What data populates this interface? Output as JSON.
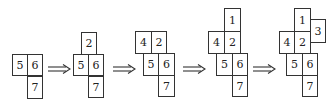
{
  "stages": [
    {
      "cells": [
        {
          "label": "5",
          "x": 12,
          "y": 54,
          "w": 16,
          "h": 22
        },
        {
          "label": "6",
          "x": 27,
          "y": 54,
          "w": 16,
          "h": 22
        },
        {
          "label": "7",
          "x": 27,
          "y": 76,
          "w": 16,
          "h": 23
        }
      ]
    },
    {
      "cells": [
        {
          "label": "2",
          "x": 81,
          "y": 32,
          "w": 16,
          "h": 23
        },
        {
          "label": "5",
          "x": 73,
          "y": 54,
          "w": 16,
          "h": 22
        },
        {
          "label": "6",
          "x": 88,
          "y": 54,
          "w": 16,
          "h": 22
        },
        {
          "label": "7",
          "x": 88,
          "y": 76,
          "w": 16,
          "h": 22
        }
      ]
    },
    {
      "cells": [
        {
          "label": "4",
          "x": 135,
          "y": 31,
          "w": 17,
          "h": 23
        },
        {
          "label": "2",
          "x": 151,
          "y": 31,
          "w": 16,
          "h": 23
        },
        {
          "label": "5",
          "x": 143,
          "y": 53,
          "w": 16,
          "h": 23
        },
        {
          "label": "6",
          "x": 158,
          "y": 53,
          "w": 17,
          "h": 23
        },
        {
          "label": "7",
          "x": 158,
          "y": 75,
          "w": 17,
          "h": 22
        }
      ]
    },
    {
      "cells": [
        {
          "label": "1",
          "x": 224,
          "y": 8,
          "w": 17,
          "h": 24
        },
        {
          "label": "4",
          "x": 208,
          "y": 31,
          "w": 17,
          "h": 23
        },
        {
          "label": "2",
          "x": 224,
          "y": 31,
          "w": 17,
          "h": 23
        },
        {
          "label": "5",
          "x": 216,
          "y": 53,
          "w": 17,
          "h": 23
        },
        {
          "label": "6",
          "x": 232,
          "y": 53,
          "w": 16,
          "h": 23
        },
        {
          "label": "7",
          "x": 232,
          "y": 75,
          "w": 16,
          "h": 22
        }
      ]
    },
    {
      "cells": [
        {
          "label": "1",
          "x": 294,
          "y": 8,
          "w": 17,
          "h": 24
        },
        {
          "label": "3",
          "x": 310,
          "y": 19,
          "w": 16,
          "h": 24
        },
        {
          "label": "4",
          "x": 279,
          "y": 31,
          "w": 16,
          "h": 23
        },
        {
          "label": "2",
          "x": 294,
          "y": 31,
          "w": 17,
          "h": 23
        },
        {
          "label": "5",
          "x": 286,
          "y": 53,
          "w": 17,
          "h": 23
        },
        {
          "label": "6",
          "x": 302,
          "y": 53,
          "w": 16,
          "h": 23
        },
        {
          "label": "7",
          "x": 302,
          "y": 75,
          "w": 16,
          "h": 22
        }
      ]
    }
  ],
  "arrows": [
    {
      "symbol": "double-right-arrow",
      "x": 48,
      "y": 64
    },
    {
      "symbol": "double-right-arrow",
      "x": 113,
      "y": 64
    },
    {
      "symbol": "double-right-arrow",
      "x": 183,
      "y": 64
    },
    {
      "symbol": "double-right-arrow",
      "x": 253,
      "y": 64
    }
  ],
  "colors": {
    "line": "#333333",
    "text": "#222222",
    "background": "#ffffff"
  }
}
